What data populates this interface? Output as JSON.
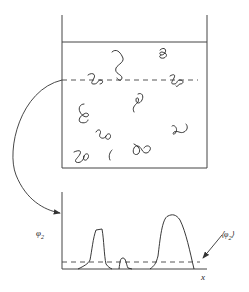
{
  "diagram": {
    "type": "polymer-solution-concentration-profile",
    "container": {
      "description": "beaker containing dispersed polymer coils",
      "coil_count": 11,
      "has_sampling_line": true
    },
    "arrow": {
      "description": "curved arrow from sampling line to concentration profile"
    },
    "profile": {
      "y_label": "φ",
      "y_label_sub": "2",
      "x_label": "x",
      "mean_label_open": "⟨φ",
      "mean_label_sub": "2",
      "mean_label_close": "⟩",
      "description": "local polymer volume fraction along dashed line; peaks where line crosses coils, dashed line marks average"
    },
    "colors": {
      "stroke": "#333333",
      "background": "#ffffff"
    }
  }
}
